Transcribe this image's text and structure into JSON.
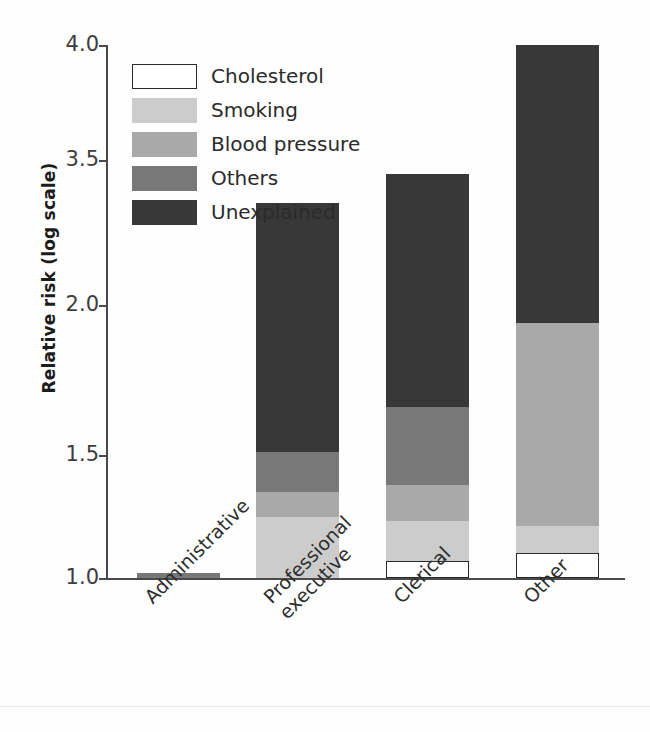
{
  "chart_data": {
    "type": "bar",
    "stacked": true,
    "title": "",
    "subtitle": "",
    "xlabel": "",
    "ylabel": "Relative risk (log scale)",
    "grid": false,
    "legend_position": "inside-top-left",
    "y_tick_labels": [
      "4.0",
      "3.5",
      "2.0",
      "1.5",
      "1.0"
    ],
    "y_tick_values": [
      4.0,
      3.5,
      2.0,
      1.5,
      1.0
    ],
    "ylim": [
      1.0,
      4.0
    ],
    "categories": [
      "Administrative",
      "Professional executive",
      "Clerical",
      "Other"
    ],
    "category_label_lines": [
      [
        "Administrative"
      ],
      [
        "Professional",
        "executive"
      ],
      [
        "Clerical"
      ],
      [
        "Other"
      ]
    ],
    "series": [
      {
        "name": "Cholesterol",
        "color": "#ffffff",
        "values": [
          0.0,
          0.0,
          0.07,
          0.1
        ]
      },
      {
        "name": "Smoking",
        "color": "#cccccc",
        "values": [
          0.0,
          0.25,
          0.16,
          0.11
        ]
      },
      {
        "name": "Blood pressure",
        "color": "#a9a9a9",
        "values": [
          0.0,
          0.1,
          0.15,
          0.73
        ]
      },
      {
        "name": "Others",
        "color": "#787878",
        "values": [
          0.02,
          0.16,
          0.28,
          0.0
        ]
      },
      {
        "name": "Unexplained",
        "color": "#383838",
        "values": [
          0.0,
          1.55,
          1.7,
          2.11
        ]
      }
    ],
    "totals": [
      1.02,
      2.06,
      3.59,
      4.05
    ],
    "annotations": []
  },
  "legend": {
    "items": [
      {
        "label": "Cholesterol",
        "swatch": "#ffffff"
      },
      {
        "label": "Smoking",
        "swatch": "#cccccc"
      },
      {
        "label": "Blood pressure",
        "swatch": "#a9a9a9"
      },
      {
        "label": "Others",
        "swatch": "#787878"
      },
      {
        "label": "Unexplained",
        "swatch": "#383838"
      }
    ]
  },
  "footer": {
    "cropped_text": ""
  }
}
